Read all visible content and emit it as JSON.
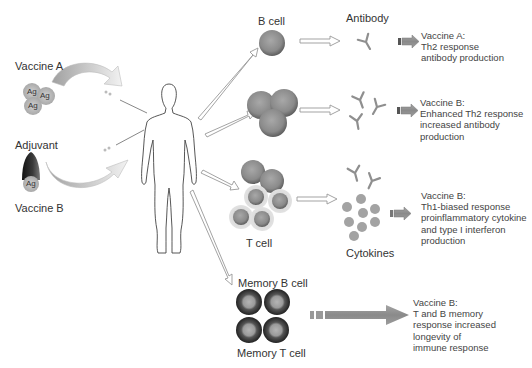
{
  "left": {
    "vaccine_a_label": "Vaccine A",
    "adjuvant_label": "Adjuvant",
    "vaccine_b_label": "Vaccine B",
    "antigen_label": "Ag"
  },
  "cells": {
    "b_cell": "B cell",
    "t_cell": "T cell",
    "memory_b_cell": "Memory B cell",
    "memory_t_cell": "Memory T cell"
  },
  "products": {
    "antibody": "Antibody",
    "cytokines": "Cytokines"
  },
  "outcomes": [
    {
      "lines": [
        "Vaccine A:",
        "Th2 response",
        "antibody production"
      ]
    },
    {
      "lines": [
        "Vaccine B:",
        "Enhanced Th2 response",
        "increased antibody",
        "production"
      ]
    },
    {
      "lines": [
        "Vaccine B:",
        "Th1-biased response",
        "proinflammatory cytokine",
        "and type I interferon",
        "production"
      ]
    },
    {
      "lines": [
        "Vaccine B:",
        "T and B memory",
        "response increased",
        "longevity of",
        "immune response"
      ]
    }
  ],
  "colors": {
    "cell_fill": "#8a8a8a",
    "cell_outline": "#5e5e5e",
    "memory_cell_dark": "#2f2f2f",
    "arrow_fill": "#8c8c8c",
    "hollow_arrow": "#9a9a9a"
  }
}
